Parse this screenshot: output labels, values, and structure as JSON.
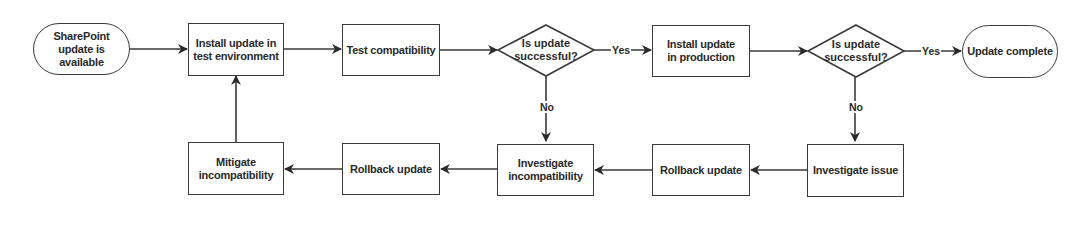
{
  "diagram": {
    "type": "flowchart",
    "nodes": {
      "start": {
        "label": "SharePoint update is available",
        "shape": "terminator"
      },
      "install_test": {
        "label": "Install update in test environment",
        "shape": "process"
      },
      "test_compat": {
        "label": "Test compatibility",
        "shape": "process"
      },
      "decision1": {
        "label": "Is update successful?",
        "shape": "decision"
      },
      "install_prod": {
        "label": "Install update in production",
        "shape": "process"
      },
      "decision2": {
        "label": "Is update successful?",
        "shape": "decision"
      },
      "end": {
        "label": "Update complete",
        "shape": "terminator"
      },
      "mitigate": {
        "label": "Mitigate incompatibility",
        "shape": "process"
      },
      "rollback1": {
        "label": "Rollback update",
        "shape": "process"
      },
      "investigate_incompat": {
        "label": "Investigate incompatibility",
        "shape": "process"
      },
      "rollback2": {
        "label": "Rollback update",
        "shape": "process"
      },
      "investigate_issue": {
        "label": "Investigate issue",
        "shape": "process"
      }
    },
    "edges": [
      {
        "from": "start",
        "to": "install_test",
        "label": ""
      },
      {
        "from": "install_test",
        "to": "test_compat",
        "label": ""
      },
      {
        "from": "test_compat",
        "to": "decision1",
        "label": ""
      },
      {
        "from": "decision1",
        "to": "install_prod",
        "label": "Yes"
      },
      {
        "from": "decision1",
        "to": "investigate_incompat",
        "label": "No"
      },
      {
        "from": "install_prod",
        "to": "decision2",
        "label": ""
      },
      {
        "from": "decision2",
        "to": "end",
        "label": "Yes"
      },
      {
        "from": "decision2",
        "to": "investigate_issue",
        "label": "No"
      },
      {
        "from": "investigate_issue",
        "to": "rollback2",
        "label": ""
      },
      {
        "from": "rollback2",
        "to": "investigate_incompat",
        "label": ""
      },
      {
        "from": "investigate_incompat",
        "to": "rollback1",
        "label": ""
      },
      {
        "from": "rollback1",
        "to": "mitigate",
        "label": ""
      },
      {
        "from": "mitigate",
        "to": "install_test",
        "label": ""
      }
    ],
    "edge_labels": {
      "d1_yes": "Yes",
      "d1_no": "No",
      "d2_yes": "Yes",
      "d2_no": "No"
    },
    "colors": {
      "stroke": "#3a3a3a",
      "text": "#2a2a2a",
      "background": "#ffffff"
    }
  }
}
